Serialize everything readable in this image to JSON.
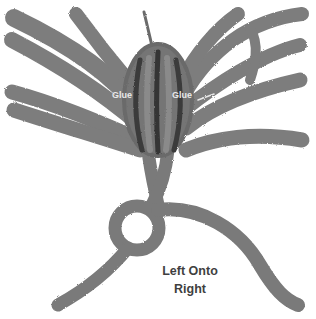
{
  "diagram": {
    "labels": {
      "glue_left": "Glue",
      "glue_right": "Glue"
    },
    "caption": {
      "line1": "Left Onto",
      "line2": "Right"
    },
    "colors": {
      "rope": "#7b7b7b",
      "rope_dark": "#5a5a5a",
      "bundle_core": "#3e3e3e",
      "background": "#ffffff",
      "caption_text": "#3f3f3f",
      "glue_text": "#e9e9e9"
    }
  }
}
